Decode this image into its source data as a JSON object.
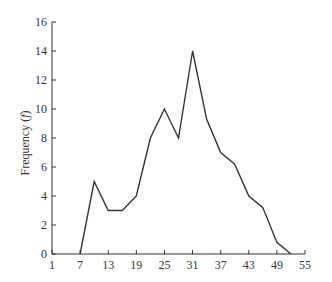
{
  "chart_data": {
    "type": "line",
    "title": "",
    "xlabel": "",
    "ylabel": "Frequency",
    "ylabel_symbol": "f",
    "x": [
      7,
      10,
      13,
      16,
      19,
      22,
      25,
      28,
      31,
      34,
      37,
      40,
      43,
      46,
      49,
      52
    ],
    "series": [
      {
        "name": "Frequency",
        "values": [
          0,
          5,
          3,
          3,
          4,
          8,
          10,
          8,
          14,
          9.3,
          7,
          6.2,
          4,
          3.2,
          0.8,
          0
        ]
      }
    ],
    "xlim": [
      1,
      55
    ],
    "ylim": [
      0,
      16
    ],
    "x_ticks": [
      1,
      7,
      13,
      19,
      25,
      31,
      37,
      43,
      49,
      55
    ],
    "y_ticks": [
      0,
      2,
      4,
      6,
      8,
      10,
      12,
      14,
      16
    ],
    "grid": false,
    "legend": null,
    "line_color": "#333333"
  }
}
